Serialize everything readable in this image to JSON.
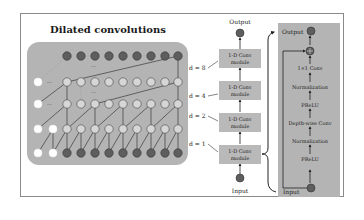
{
  "figure": {
    "left_panel": {
      "title": "Dilated convolutions",
      "rows": 5,
      "columns_visible": 9,
      "ellipsis": "···"
    },
    "middle_stack": {
      "output_label": "Output",
      "input_label": "Input",
      "modules": [
        {
          "dilation_label": "d = 8",
          "line1": "1-D Conv",
          "line2": "module"
        },
        {
          "dilation_label": "d = 4",
          "line1": "1-D Conv",
          "line2": "module"
        },
        {
          "dilation_label": "d = 2",
          "line1": "1-D Conv",
          "line2": "module"
        },
        {
          "dilation_label": "d = 1",
          "line1": "1-D Conv",
          "line2": "module"
        }
      ]
    },
    "module_detail": {
      "output_label": "Output",
      "input_label": "Input",
      "add_symbol": "⊕",
      "layers": [
        "1×1 Conv",
        "Normalization",
        "PReLU",
        "Depth-wise Conv",
        "Normalization",
        "PReLU",
        "1×1 Conv"
      ]
    },
    "colors": {
      "panel_grey": "#b4b4b4",
      "box_grey": "#b9b9b9",
      "node_dark": "#5e5e5e",
      "node_light": "#d6d6d6",
      "node_white": "#ffffff",
      "line": "#333333"
    }
  }
}
